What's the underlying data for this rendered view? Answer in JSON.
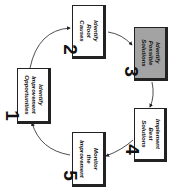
{
  "diagram": {
    "type": "cycle",
    "orientation": "rotated-90-clockwise",
    "highlight_color": "#a3a3a3",
    "steps": [
      {
        "number": "1",
        "lines": [
          "Identify",
          "Improvement",
          "Opportunities"
        ],
        "highlighted": false
      },
      {
        "number": "2",
        "lines": [
          "Identify",
          "Root",
          "Causes"
        ],
        "highlighted": false
      },
      {
        "number": "3",
        "lines": [
          "Identify",
          "Possible",
          "Solutions"
        ],
        "highlighted": true
      },
      {
        "number": "4",
        "lines": [
          "Implement",
          "Best",
          "Solutions"
        ],
        "highlighted": false
      },
      {
        "number": "5",
        "lines": [
          "Monitor",
          "the",
          "Improvement"
        ],
        "highlighted": false
      }
    ]
  }
}
